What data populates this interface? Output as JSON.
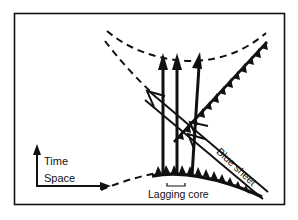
{
  "figure": {
    "type": "space-time-diagram",
    "background_color": "#ffffff",
    "ink_color": "#111111",
    "frame": {
      "name": "figure-border",
      "x": 14,
      "y": 13,
      "width": 271,
      "height": 192,
      "stroke_width": 1.6
    }
  },
  "axes": {
    "vertical_axis_label": "Time",
    "horizontal_axis_label": "Space",
    "vertical_arrow": {
      "x": 37,
      "y_bottom": 186,
      "y_top": 147
    },
    "horizontal_arrow": {
      "y": 186,
      "x_left": 37,
      "x_right": 110
    }
  },
  "annotations": {
    "lagging_core": "Lagging core",
    "blue_sheet": "Blue sheet"
  },
  "features": {
    "upward_flow_arrows_count": 3,
    "dashed_isochrons_count": 3,
    "thrust_faults_count": 2,
    "blue_sheet_arrowheads_count": 2
  }
}
